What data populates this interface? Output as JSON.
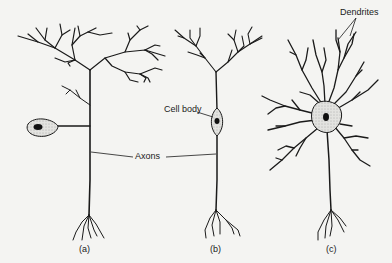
{
  "figure": {
    "labels": {
      "dendrites": "Dendrites",
      "cell_body": "Cell body",
      "axons": "Axons"
    },
    "panels": [
      {
        "id": "a",
        "caption": "(a)",
        "type": "unipolar neuron"
      },
      {
        "id": "b",
        "caption": "(b)",
        "type": "bipolar neuron"
      },
      {
        "id": "c",
        "caption": "(c)",
        "type": "multipolar neuron"
      }
    ],
    "colors": {
      "background": "#f4f4f2",
      "ink": "#1a1a1a",
      "soma_fill": "#d9d9d6",
      "nucleus": "#111111"
    }
  }
}
